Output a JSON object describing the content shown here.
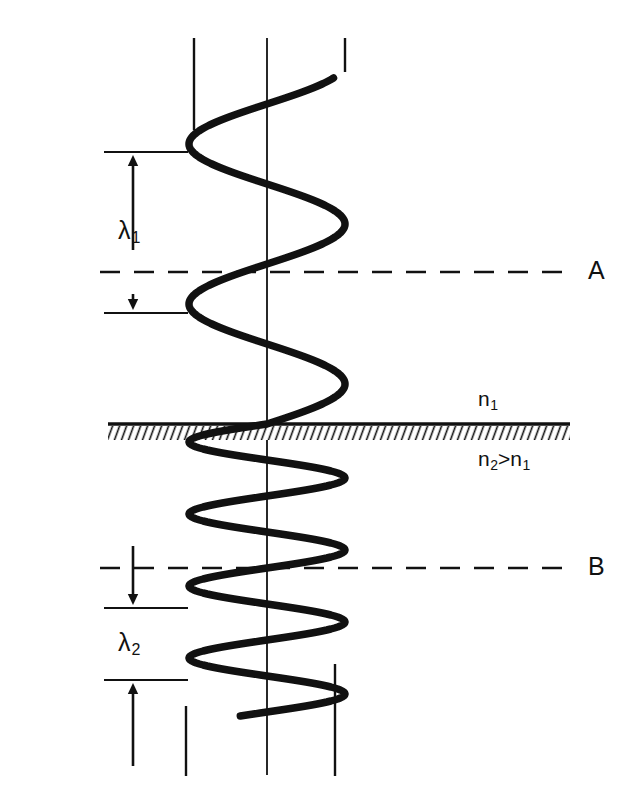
{
  "figure": {
    "background_color": "#ffffff",
    "ink_color": "#111111",
    "width": 634,
    "height": 808
  },
  "labels": {
    "lambda1": "λ",
    "lambda1_sub": "1",
    "lambda2": "λ",
    "lambda2_sub": "2",
    "n1": "n",
    "n1_sub": "1",
    "n2_expr_lead": "n",
    "n2_expr_sub": "2",
    "n2_expr_mid": ">n",
    "n2_expr_sub2": "1",
    "line_a": "A",
    "line_b": "B"
  },
  "media": {
    "upper": {
      "name": "n1",
      "refractive_index_label": "n₁",
      "region_top": 0,
      "region_bottom": 424
    },
    "lower": {
      "name": "n2",
      "refractive_index_label": "n₂>n₁",
      "region_top": 424,
      "region_bottom": 808
    }
  },
  "chart_data": {
    "type": "line",
    "orientation": "vertical-propagation",
    "xlabel": "",
    "ylabel": "",
    "axis_x": 267,
    "interface_y": 424,
    "amplitude_px": 78,
    "wavelength_upper_px": 160,
    "wavelength_lower_px": 72,
    "wave_start_y": 78,
    "wave_end_y": 716,
    "left_extreme_x": 189,
    "right_extreme_x": 345,
    "annotations": [
      {
        "name": "lambda1",
        "label": "λ1",
        "type": "measure",
        "y_top": 152,
        "y_bottom": 313,
        "x": 133,
        "value_px": 161
      },
      {
        "name": "lambda2",
        "label": "λ2",
        "type": "measure",
        "y_top": 608,
        "y_bottom": 680,
        "x": 133,
        "value_px": 72
      },
      {
        "name": "line_a",
        "label": "A",
        "type": "dashed-reference",
        "y": 272
      },
      {
        "name": "line_b",
        "label": "B",
        "type": "dashed-reference",
        "y": 568
      }
    ]
  },
  "reference_lines": [
    {
      "id": "A",
      "label": "A",
      "y": 272,
      "x_start": 100,
      "x_end": 570,
      "style": "dashed",
      "label_x": 588
    },
    {
      "id": "B",
      "label": "B",
      "y": 568,
      "x_start": 100,
      "x_end": 570,
      "style": "dashed",
      "label_x": 588
    }
  ],
  "interface": {
    "y": 424,
    "x_start": 108,
    "x_end": 570,
    "hatch_height": 14,
    "style": "solid-with-hatching"
  },
  "tick_marks": [
    {
      "id": "top-left",
      "x": 194,
      "y_start": 38,
      "y_end": 130
    },
    {
      "id": "top-axis",
      "x": 267,
      "y_start": 38,
      "y_end": 775
    },
    {
      "id": "top-right",
      "x": 345,
      "y_start": 38,
      "y_end": 72
    },
    {
      "id": "bottom-left",
      "x": 186,
      "y_start": 706,
      "y_end": 776
    },
    {
      "id": "bottom-right",
      "x": 335,
      "y_start": 664,
      "y_end": 776
    }
  ],
  "measure_ticks": [
    {
      "id": "lambda1-top",
      "y": 152,
      "x_start": 104,
      "x_end": 188
    },
    {
      "id": "lambda1-bottom",
      "y": 313,
      "x_start": 104,
      "x_end": 188
    },
    {
      "id": "lambda2-top",
      "y": 608,
      "x_start": 104,
      "x_end": 188
    },
    {
      "id": "lambda2-bottom",
      "y": 680,
      "x_start": 104,
      "x_end": 188
    }
  ],
  "label_positions": {
    "lambda1": {
      "x": 118,
      "y": 218
    },
    "lambda2": {
      "x": 118,
      "y": 630
    },
    "n1": {
      "x": 478,
      "y": 388
    },
    "n2": {
      "x": 478,
      "y": 448
    },
    "line_a": {
      "x": 588,
      "y": 258
    },
    "line_b": {
      "x": 588,
      "y": 554
    }
  }
}
